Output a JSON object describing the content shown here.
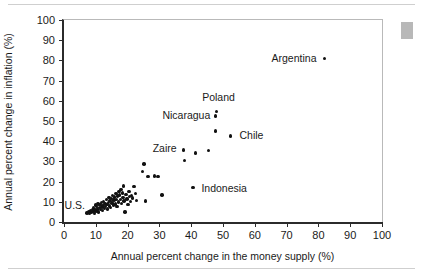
{
  "figure": {
    "background_color": "#ffffff",
    "rule_color": "#cfcfcf",
    "marker_color": "#b8b8b8",
    "point_color": "#111111",
    "axis_color": "#2b2b2b"
  },
  "chart_data": {
    "type": "scatter",
    "title": "",
    "xlabel": "Annual percent change in the money supply (%)",
    "ylabel": "Annual percent change in inflation (%)",
    "xlim": [
      0,
      100
    ],
    "ylim": [
      0,
      100
    ],
    "xticks": [
      0,
      10,
      20,
      30,
      40,
      50,
      60,
      70,
      80,
      90,
      100
    ],
    "yticks": [
      0,
      10,
      20,
      30,
      40,
      50,
      60,
      70,
      80,
      90,
      100
    ],
    "grid": false,
    "legend": null,
    "series": [
      {
        "name": "countries",
        "points": [
          [
            7.2,
            4.4
          ],
          [
            7.8,
            5.0
          ],
          [
            8.1,
            4.1
          ],
          [
            8.4,
            5.6
          ],
          [
            8.6,
            4.6
          ],
          [
            8.9,
            6.2
          ],
          [
            9.1,
            5.2
          ],
          [
            9.3,
            7.0
          ],
          [
            9.5,
            4.2
          ],
          [
            9.7,
            6.0
          ],
          [
            9.9,
            8.4
          ],
          [
            10.1,
            5.4
          ],
          [
            10.3,
            7.6
          ],
          [
            10.5,
            6.4
          ],
          [
            10.7,
            9.0
          ],
          [
            10.9,
            5.0
          ],
          [
            11.1,
            7.2
          ],
          [
            11.3,
            8.8
          ],
          [
            11.5,
            6.2
          ],
          [
            11.7,
            9.6
          ],
          [
            11.9,
            7.4
          ],
          [
            12.1,
            5.8
          ],
          [
            12.3,
            8.2
          ],
          [
            12.5,
            10.2
          ],
          [
            12.7,
            6.8
          ],
          [
            12.9,
            9.2
          ],
          [
            13.1,
            7.8
          ],
          [
            13.3,
            11.0
          ],
          [
            13.5,
            8.6
          ],
          [
            13.7,
            6.4
          ],
          [
            13.9,
            9.8
          ],
          [
            14.1,
            12.0
          ],
          [
            14.3,
            8.0
          ],
          [
            14.5,
            10.6
          ],
          [
            14.7,
            7.2
          ],
          [
            14.9,
            11.6
          ],
          [
            15.1,
            9.4
          ],
          [
            15.3,
            13.0
          ],
          [
            15.5,
            8.4
          ],
          [
            15.7,
            10.8
          ],
          [
            15.9,
            12.4
          ],
          [
            16.1,
            9.0
          ],
          [
            16.3,
            14.0
          ],
          [
            16.5,
            11.2
          ],
          [
            16.7,
            7.8
          ],
          [
            16.9,
            12.8
          ],
          [
            17.1,
            10.0
          ],
          [
            17.3,
            15.2
          ],
          [
            17.5,
            13.4
          ],
          [
            17.7,
            11.0
          ],
          [
            17.9,
            16.0
          ],
          [
            18.1,
            9.2
          ],
          [
            18.3,
            14.4
          ],
          [
            18.5,
            12.2
          ],
          [
            18.7,
            17.8
          ],
          [
            18.9,
            10.4
          ],
          [
            19.2,
            5.0
          ],
          [
            19.5,
            13.6
          ],
          [
            19.8,
            11.4
          ],
          [
            20.1,
            8.6
          ],
          [
            20.4,
            15.0
          ],
          [
            20.6,
            12.6
          ],
          [
            20.9,
            10.2
          ],
          [
            21.2,
            13.2
          ],
          [
            21.6,
            11.8
          ],
          [
            22.0,
            17.6
          ],
          [
            22.4,
            14.2
          ],
          [
            22.8,
            10.6
          ],
          [
            24.6,
            25.0
          ],
          [
            25.2,
            28.8
          ],
          [
            26.4,
            22.6
          ],
          [
            28.4,
            22.8
          ],
          [
            29.6,
            22.6
          ],
          [
            25.6,
            10.4
          ],
          [
            30.8,
            13.4
          ],
          [
            37.8,
            30.6
          ],
          [
            37.6,
            35.6
          ],
          [
            41.4,
            34.2
          ],
          [
            45.4,
            35.4
          ],
          [
            40.6,
            17.0
          ],
          [
            47.6,
            52.4
          ],
          [
            47.9,
            54.6
          ],
          [
            47.6,
            45.0
          ],
          [
            52.4,
            42.6
          ],
          [
            82.0,
            81.0
          ]
        ]
      }
    ],
    "annotations": [
      {
        "text": "U.S.",
        "x": 6.6,
        "y": 8.6,
        "anchor": "left"
      },
      {
        "text": "Zaire",
        "x": 35.4,
        "y": 36.4,
        "anchor": "left"
      },
      {
        "text": "Nicaragua",
        "x": 46.0,
        "y": 53.2,
        "anchor": "left"
      },
      {
        "text": "Poland",
        "x": 48.6,
        "y": 59.0,
        "anchor": "above"
      },
      {
        "text": "Chile",
        "x": 55.2,
        "y": 43.0,
        "anchor": "right"
      },
      {
        "text": "Indonesia",
        "x": 43.2,
        "y": 17.0,
        "anchor": "right"
      },
      {
        "text": "Argentina",
        "x": 79.4,
        "y": 81.0,
        "anchor": "left"
      }
    ]
  }
}
